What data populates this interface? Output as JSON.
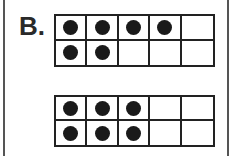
{
  "problem": {
    "label": "B."
  },
  "ten_frames": [
    {
      "name": "ten-frame-top",
      "top": 14,
      "height": 53,
      "rows": [
        [
          true,
          true,
          true,
          true,
          false
        ],
        [
          true,
          true,
          false,
          false,
          false
        ]
      ],
      "count": 6
    },
    {
      "name": "ten-frame-bottom",
      "top": 95,
      "height": 52,
      "rows": [
        [
          true,
          true,
          true,
          false,
          false
        ],
        [
          true,
          true,
          true,
          false,
          false
        ]
      ],
      "count": 6
    }
  ],
  "colors": {
    "dot": "#1a1a1a",
    "grid": "#222222",
    "background": "#ffffff"
  }
}
